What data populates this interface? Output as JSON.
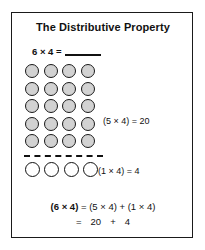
{
  "card": {
    "title": "The Distributive Property",
    "problem": {
      "expression": "6 × 4 =",
      "answer_blank": ""
    },
    "grid": {
      "rows": 5,
      "columns": 4,
      "fill_color": "#d2d2d2",
      "border_color": "#1a1a1a",
      "label": "(5 × 4) = 20"
    },
    "separator": {
      "style": "dashed",
      "color": "#111111"
    },
    "remainder_row": {
      "rows": 1,
      "columns": 4,
      "fill_color": "#ffffff",
      "border_color": "#111111",
      "label": "(1 × 4) = 4"
    },
    "summary": {
      "line1_lead": "(6 × 4)",
      "line1_rest": " = (5 × 4) + (1 × 4)",
      "line2_equals": "=",
      "line2_first": "20",
      "line2_plus": "+",
      "line2_second": "4"
    }
  }
}
